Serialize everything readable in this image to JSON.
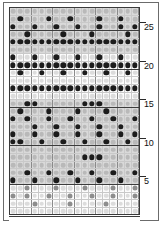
{
  "figure": {
    "kind": "bead-knitting-chart",
    "title": "",
    "columns": 18,
    "rows": 27,
    "background_color": "#ffffff",
    "frame_color": "#6b6b6b",
    "grid_line_color": "#c9c9c9",
    "major_line_color": "#3c3c3c",
    "band_dark_color": "#d9d9d9",
    "band_light_color": "#fcfcfc",
    "bead_light_color": "#b9b9b9",
    "bead_mid_color": "#8d8d8d",
    "bead_dark_color": "#1c1c1c"
  },
  "axis": {
    "position": "right",
    "direction": "bottom-to-top",
    "tick_labels": [
      "25",
      "20",
      "15",
      "10",
      "5"
    ],
    "tick_rows": [
      25,
      20,
      15,
      10,
      5
    ]
  },
  "chart_data": {
    "type": "heatmap",
    "xlabel": "",
    "ylabel": "Row",
    "legend": [],
    "grid": true,
    "columns": 18,
    "rows": 27,
    "value_legend": {
      "0": "light bead (background)",
      "1": "mid bead",
      "2": "dark bead (pattern)"
    },
    "x": [
      1,
      2,
      3,
      4,
      5,
      6,
      7,
      8,
      9,
      10,
      11,
      12,
      13,
      14,
      15,
      16,
      17,
      18
    ],
    "row_labels_visible": [
      "25",
      "20",
      "15",
      "10",
      "5"
    ],
    "row_bands": [
      "dark",
      "dark",
      "dark",
      "dark",
      "dark",
      "dark",
      "light",
      "light",
      "light",
      "light",
      "light",
      "light",
      "dark",
      "dark",
      "dark",
      "dark",
      "dark",
      "dark",
      "dark",
      "dark",
      "dark",
      "dark",
      "dark",
      "light",
      "light",
      "light",
      "light"
    ],
    "matrix": [
      [
        0,
        0,
        0,
        0,
        0,
        0,
        0,
        0,
        0,
        0,
        0,
        0,
        0,
        0,
        0,
        0,
        0,
        0
      ],
      [
        0,
        2,
        0,
        0,
        0,
        2,
        0,
        0,
        2,
        0,
        0,
        0,
        2,
        0,
        0,
        2,
        0,
        0
      ],
      [
        2,
        0,
        0,
        2,
        0,
        0,
        2,
        0,
        0,
        2,
        0,
        0,
        2,
        0,
        0,
        2,
        0,
        2
      ],
      [
        0,
        0,
        2,
        0,
        0,
        0,
        0,
        2,
        0,
        0,
        0,
        2,
        0,
        0,
        0,
        0,
        2,
        0
      ],
      [
        2,
        2,
        2,
        2,
        2,
        2,
        2,
        2,
        2,
        2,
        2,
        2,
        2,
        2,
        2,
        2,
        2,
        2
      ],
      [
        0,
        0,
        0,
        0,
        0,
        0,
        0,
        0,
        0,
        0,
        0,
        0,
        0,
        0,
        0,
        0,
        0,
        0
      ],
      [
        2,
        0,
        0,
        2,
        0,
        0,
        2,
        0,
        0,
        2,
        0,
        0,
        2,
        0,
        0,
        2,
        0,
        0
      ],
      [
        2,
        2,
        2,
        2,
        2,
        2,
        2,
        2,
        2,
        2,
        2,
        2,
        2,
        2,
        2,
        2,
        2,
        2
      ],
      [
        0,
        2,
        0,
        0,
        2,
        0,
        0,
        2,
        0,
        0,
        2,
        0,
        0,
        2,
        0,
        0,
        2,
        0
      ],
      [
        0,
        0,
        0,
        0,
        0,
        0,
        0,
        0,
        0,
        0,
        0,
        0,
        0,
        0,
        0,
        0,
        0,
        0
      ],
      [
        2,
        2,
        2,
        2,
        2,
        2,
        2,
        2,
        2,
        2,
        2,
        2,
        2,
        2,
        2,
        2,
        2,
        2
      ],
      [
        0,
        0,
        0,
        0,
        0,
        0,
        0,
        0,
        0,
        0,
        0,
        0,
        0,
        0,
        0,
        0,
        0,
        0
      ],
      [
        0,
        0,
        2,
        2,
        0,
        0,
        0,
        0,
        0,
        0,
        2,
        2,
        2,
        0,
        0,
        0,
        0,
        0
      ],
      [
        0,
        2,
        0,
        0,
        0,
        2,
        0,
        0,
        0,
        2,
        0,
        0,
        0,
        2,
        0,
        0,
        0,
        0
      ],
      [
        2,
        0,
        2,
        0,
        0,
        2,
        0,
        0,
        2,
        0,
        0,
        2,
        0,
        0,
        2,
        0,
        0,
        2
      ],
      [
        0,
        0,
        0,
        2,
        0,
        0,
        2,
        0,
        0,
        2,
        0,
        0,
        2,
        0,
        0,
        2,
        0,
        0
      ],
      [
        2,
        0,
        0,
        2,
        0,
        0,
        2,
        0,
        0,
        2,
        0,
        0,
        2,
        0,
        0,
        2,
        0,
        2
      ],
      [
        2,
        2,
        0,
        0,
        2,
        0,
        0,
        2,
        0,
        0,
        2,
        0,
        0,
        2,
        0,
        0,
        2,
        0
      ],
      [
        0,
        0,
        0,
        0,
        0,
        0,
        0,
        0,
        0,
        0,
        0,
        0,
        0,
        0,
        0,
        0,
        0,
        0
      ],
      [
        0,
        0,
        0,
        0,
        0,
        0,
        0,
        0,
        0,
        0,
        2,
        2,
        2,
        0,
        0,
        0,
        0,
        0
      ],
      [
        0,
        0,
        0,
        0,
        0,
        0,
        0,
        0,
        0,
        0,
        0,
        0,
        0,
        0,
        0,
        0,
        0,
        0
      ],
      [
        0,
        0,
        2,
        0,
        0,
        2,
        0,
        0,
        2,
        0,
        0,
        2,
        0,
        0,
        2,
        0,
        0,
        2
      ],
      [
        2,
        0,
        0,
        2,
        0,
        0,
        2,
        0,
        0,
        2,
        0,
        0,
        2,
        0,
        0,
        2,
        0,
        0
      ],
      [
        0,
        0,
        1,
        0,
        0,
        0,
        1,
        0,
        0,
        0,
        1,
        0,
        0,
        0,
        1,
        0,
        0,
        1
      ],
      [
        1,
        0,
        1,
        0,
        0,
        1,
        0,
        0,
        1,
        0,
        0,
        1,
        0,
        0,
        1,
        0,
        0,
        1
      ],
      [
        0,
        0,
        0,
        1,
        0,
        0,
        0,
        0,
        1,
        0,
        0,
        0,
        0,
        1,
        0,
        0,
        0,
        0
      ],
      [
        0,
        0,
        0,
        0,
        0,
        0,
        0,
        0,
        0,
        0,
        0,
        0,
        0,
        0,
        0,
        0,
        0,
        0
      ]
    ]
  }
}
